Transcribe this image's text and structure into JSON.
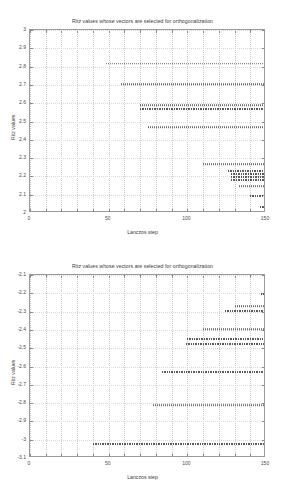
{
  "figure": {
    "background_color": "#ffffff",
    "axis_color": "#9a9a9a",
    "marker_color": "#6e6e6e",
    "grid_color": "#c8c8c8"
  },
  "charts": [
    {
      "id": "top",
      "title": "Ritz values whose vectors are selected for orthogonalization",
      "xlabel": "Lanczos step",
      "ylabel": "Ritz values",
      "xlim": [
        0,
        150
      ],
      "ylim": [
        2,
        3
      ],
      "xticks": [
        0,
        50,
        100,
        150
      ],
      "xticklabels": [
        "0",
        "50",
        "100",
        "150"
      ],
      "yticks": [
        2,
        2.1,
        2.2,
        2.3,
        2.4,
        2.5,
        2.6,
        2.7,
        2.8,
        2.9,
        3
      ],
      "yticklabels": [
        "2",
        "2.1",
        "2.2",
        "2.3",
        "2.4",
        "2.5",
        "2.6",
        "2.7",
        "2.8",
        "2.9",
        "3"
      ],
      "grid": true,
      "type": "scatter"
    },
    {
      "id": "bottom",
      "title": "Ritz values whose vectors are selected for orthogonalization",
      "xlabel": "Lanczos step",
      "ylabel": "Ritz values",
      "xlim": [
        0,
        150
      ],
      "ylim": [
        -3.1,
        -2.1
      ],
      "xticks": [
        0,
        50,
        100,
        150
      ],
      "xticklabels": [
        "0",
        "50",
        "100",
        "150"
      ],
      "yticks": [
        -3.1,
        -3,
        -2.9,
        -2.8,
        -2.7,
        -2.6,
        -2.5,
        -2.4,
        -2.3,
        -2.2,
        -2.1
      ],
      "yticklabels": [
        "-3.1",
        "-3",
        "-2.9",
        "-2.8",
        "-2.7",
        "-2.6",
        "-2.5",
        "-2.4",
        "-2.3",
        "-2.2",
        "-2.1"
      ],
      "grid": true,
      "type": "scatter"
    }
  ],
  "chart_data": [
    {
      "type": "scatter",
      "title": "Ritz values whose vectors are selected for orthogonalization",
      "xlabel": "Lanczos step",
      "ylabel": "Ritz values",
      "xlim": [
        0,
        150
      ],
      "ylim": [
        2,
        3
      ],
      "xticks": [
        0,
        50,
        100,
        150
      ],
      "yticks": [
        2,
        2.1,
        2.2,
        2.3,
        2.4,
        2.5,
        2.6,
        2.7,
        2.8,
        2.9,
        3
      ],
      "grid": true,
      "legend": null,
      "description": "Horizontal runs of converged Ritz values; each run is a near-constant eigenvalue estimate plotted at every Lanczos step from its onset to step 150.",
      "series": [
        {
          "name": "ritz-1",
          "value": 2.815,
          "x_start": 48,
          "x_end": 150,
          "density": "normal"
        },
        {
          "name": "ritz-2",
          "value": 2.705,
          "x_start": 58,
          "x_end": 150,
          "density": "normal"
        },
        {
          "name": "ritz-3",
          "value": 2.588,
          "x_start": 70,
          "x_end": 150,
          "density": "normal"
        },
        {
          "name": "ritz-4",
          "value": 2.568,
          "x_start": 70,
          "x_end": 150,
          "density": "dense"
        },
        {
          "name": "ritz-5",
          "value": 2.47,
          "x_start": 75,
          "x_end": 150,
          "density": "normal"
        },
        {
          "name": "ritz-6",
          "value": 2.268,
          "x_start": 110,
          "x_end": 150,
          "density": "normal"
        },
        {
          "name": "ritz-7",
          "value": 2.228,
          "x_start": 126,
          "x_end": 150,
          "density": "dense"
        },
        {
          "name": "ritz-8",
          "value": 2.212,
          "x_start": 128,
          "x_end": 150,
          "density": "dense"
        },
        {
          "name": "ritz-9",
          "value": 2.196,
          "x_start": 128,
          "x_end": 150,
          "density": "dense"
        },
        {
          "name": "ritz-10",
          "value": 2.182,
          "x_start": 128,
          "x_end": 150,
          "density": "dense"
        },
        {
          "name": "ritz-11",
          "value": 2.148,
          "x_start": 133,
          "x_end": 150,
          "density": "normal"
        },
        {
          "name": "ritz-12",
          "value": 2.092,
          "x_start": 140,
          "x_end": 150,
          "density": "dense"
        },
        {
          "name": "ritz-13",
          "value": 2.035,
          "x_start": 146,
          "x_end": 150,
          "density": "dense"
        }
      ]
    },
    {
      "type": "scatter",
      "title": "Ritz values whose vectors are selected for orthogonalization",
      "xlabel": "Lanczos step",
      "ylabel": "Ritz values",
      "xlim": [
        0,
        150
      ],
      "ylim": [
        -3.1,
        -2.1
      ],
      "xticks": [
        0,
        50,
        100,
        150
      ],
      "yticks": [
        -3.1,
        -3,
        -2.9,
        -2.8,
        -2.7,
        -2.6,
        -2.5,
        -2.4,
        -2.3,
        -2.2,
        -2.1
      ],
      "grid": true,
      "legend": null,
      "description": "Horizontal runs of converged negative Ritz values; each run is plotted at every Lanczos step from its onset to step 150.",
      "series": [
        {
          "name": "ritz-n1",
          "value": -3.025,
          "x_start": 40,
          "x_end": 150,
          "density": "dense"
        },
        {
          "name": "ritz-n2",
          "value": -2.812,
          "x_start": 78,
          "x_end": 150,
          "density": "normal"
        },
        {
          "name": "ritz-n3",
          "value": -2.632,
          "x_start": 84,
          "x_end": 150,
          "density": "dense"
        },
        {
          "name": "ritz-n4",
          "value": -2.478,
          "x_start": 99,
          "x_end": 150,
          "density": "dense"
        },
        {
          "name": "ritz-n5",
          "value": -2.452,
          "x_start": 100,
          "x_end": 150,
          "density": "dense"
        },
        {
          "name": "ritz-n6",
          "value": -2.395,
          "x_start": 110,
          "x_end": 150,
          "density": "normal"
        },
        {
          "name": "ritz-n7",
          "value": -2.296,
          "x_start": 124,
          "x_end": 150,
          "density": "dense"
        },
        {
          "name": "ritz-n8",
          "value": -2.272,
          "x_start": 130,
          "x_end": 150,
          "density": "normal"
        },
        {
          "name": "ritz-n9",
          "value": -2.205,
          "x_start": 147,
          "x_end": 150,
          "density": "dense"
        }
      ]
    }
  ]
}
